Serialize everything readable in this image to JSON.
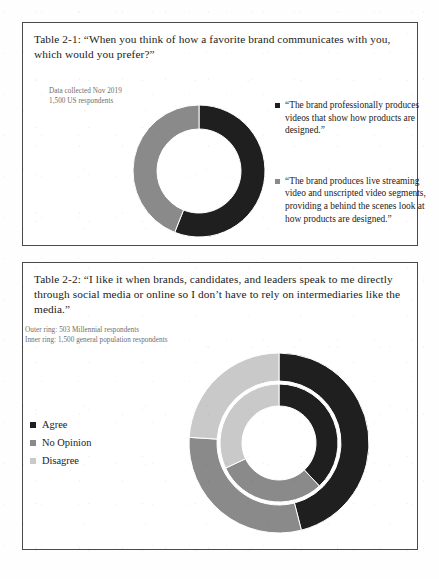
{
  "page": {
    "background": "#fefefe",
    "text_color": "#1b1b1b"
  },
  "colors": {
    "dark": "#1f1f1f",
    "mid_gray": "#8a8a8a",
    "light_gray": "#c9c9c9",
    "border": "#4a4a4a",
    "subtext": "#6d6d6d"
  },
  "figure1": {
    "caption": "Table 2-1: “When you think of how a favorite brand communicates with you, which would you prefer?”",
    "subcaption_line1": "Data collected Nov 2019",
    "subcaption_line2": "1,500 US respondents",
    "legend": [
      {
        "label": "“The brand professionally produces videos that show how products are designed.”",
        "color": "#1f1f1f"
      },
      {
        "label": "“The brand produces live streaming video and unscripted video segments, providing a behind the scenes look at how products are designed.”",
        "color": "#8a8a8a"
      }
    ]
  },
  "figure2": {
    "caption": "Table 2-2: “I like it when brands, candidates, and leaders speak to me directly through social media or online so I don’t have to rely on intermediaries like the media.”",
    "subcaption_line1": "Outer ring: 503 Millennial respondents",
    "subcaption_line2": "Inner ring: 1,500 general population respondents",
    "legend": [
      {
        "label": "Agree",
        "color": "#1f1f1f"
      },
      {
        "label": "No Opinion",
        "color": "#8a8a8a"
      },
      {
        "label": "Disagree",
        "color": "#c9c9c9"
      }
    ]
  },
  "chart_data": [
    {
      "type": "pie",
      "variant": "donut",
      "title": "Table 2-1: “When you think of how a favorite brand communicates with you, which would you prefer?”",
      "subtitle": "Data collected Nov 2019; 1,500 US respondents",
      "center_x": 68,
      "center_y": 68,
      "outer_radius": 66,
      "inner_radius": 42,
      "start_angle_deg": 0,
      "direction": "clockwise",
      "labels": [
        "“The brand professionally produces videos that show how products are designed.”",
        "“The brand produces live streaming video and unscripted video segments, providing a behind the scenes look at how products are designed.”"
      ],
      "values": [
        56,
        44
      ],
      "percent": [
        56,
        44
      ],
      "colors": [
        "#1f1f1f",
        "#8a8a8a"
      ],
      "legend_position": "right"
    },
    {
      "type": "pie",
      "variant": "double-donut",
      "title": "Table 2-2: “I like it when brands, candidates, and leaders speak to me directly through social media or online so I don’t have to rely on intermediaries like the media.”",
      "center_x": 91,
      "center_y": 91,
      "start_angle_deg": 0,
      "direction": "clockwise",
      "categories": [
        "Agree",
        "No Opinion",
        "Disagree"
      ],
      "colors": [
        "#1f1f1f",
        "#8a8a8a",
        "#c9c9c9"
      ],
      "legend_position": "left",
      "series": [
        {
          "name": "Outer ring: 503 Millennial respondents",
          "outer_radius": 90,
          "inner_radius": 62,
          "values": [
            46,
            30,
            24
          ],
          "percent": [
            46,
            30,
            24
          ]
        },
        {
          "name": "Inner ring: 1,500 general population respondents",
          "outer_radius": 59,
          "inner_radius": 37,
          "values": [
            38,
            30,
            32
          ],
          "percent": [
            38,
            30,
            32
          ]
        }
      ]
    }
  ]
}
